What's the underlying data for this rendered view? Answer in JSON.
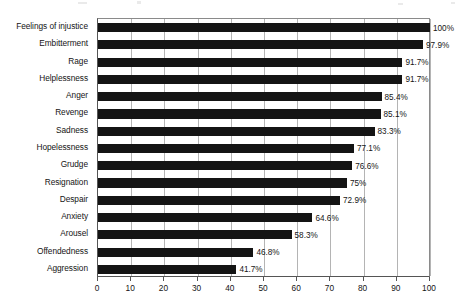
{
  "chart_data": {
    "type": "bar",
    "orientation": "horizontal",
    "title": "",
    "xlabel": "",
    "ylabel": "",
    "xlim": [
      0,
      100
    ],
    "xticks": [
      0,
      10,
      20,
      30,
      40,
      50,
      60,
      70,
      80,
      90,
      100
    ],
    "xtick_labels": [
      "0",
      "10",
      "20",
      "30",
      "40",
      "50",
      "60",
      "70",
      "80",
      "90",
      "100"
    ],
    "grid": "vertical",
    "legend": "none",
    "bar_color": "#141414",
    "grid_color": "#b4b4b4",
    "axis_color": "#555555",
    "categories": [
      "Feelings of injustice",
      "Embitterment",
      "Rage",
      "Helplessness",
      "Anger",
      "Revenge",
      "Sadness",
      "Hopelessness",
      "Grudge",
      "Resignation",
      "Despair",
      "Anxiety",
      "Arousel",
      "Offendedness",
      "Aggression"
    ],
    "values": [
      100,
      97.9,
      91.7,
      91.7,
      85.4,
      85.1,
      83.3,
      77.1,
      76.6,
      75,
      72.9,
      64.6,
      58.3,
      46.8,
      41.7
    ],
    "value_labels": [
      "100%",
      "97.9%",
      "91.7%",
      "91.7%",
      "85.4%",
      "85.1%",
      "83.3%",
      "77.1%",
      "76.6%",
      "75%",
      "72.9%",
      "64.6%",
      "58.3%",
      "46.8%",
      "41.7%"
    ]
  }
}
